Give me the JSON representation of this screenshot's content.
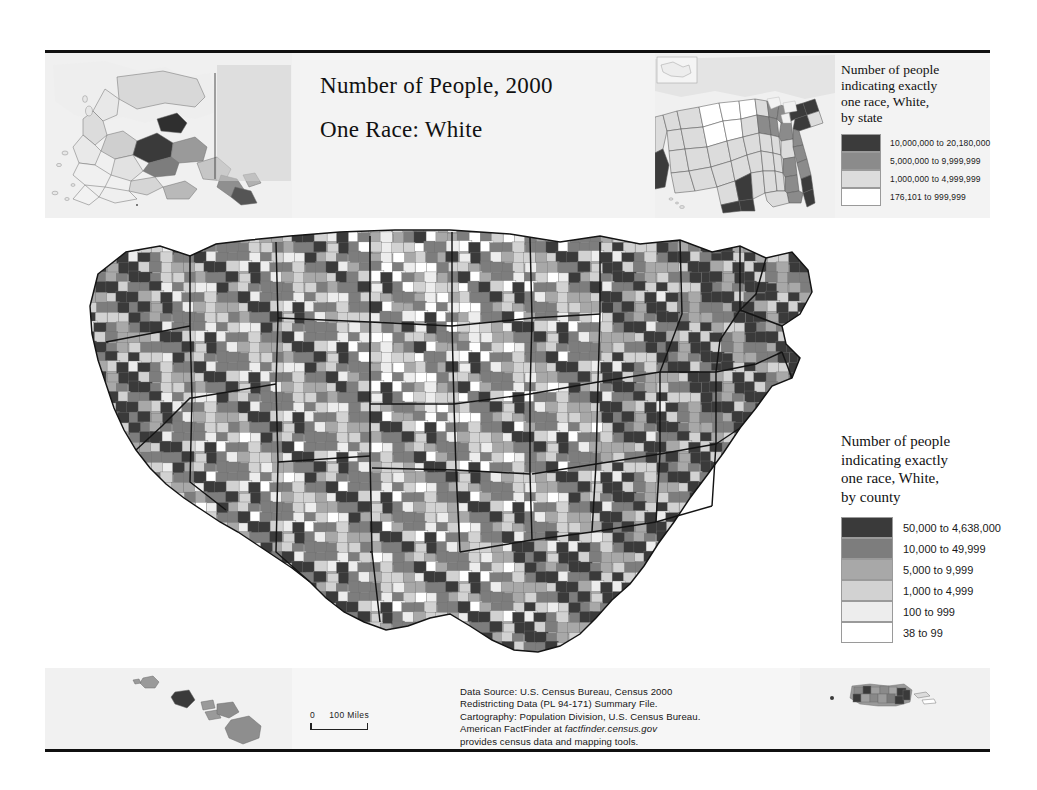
{
  "document": {
    "title_line1": "Number of People, 2000",
    "title_line2": "One Race: White"
  },
  "state_legend": {
    "heading": "Number of people indicating exactly one race, White, by state",
    "heading_lines": [
      "Number of people",
      "indicating exactly",
      "one race, White,",
      "by state"
    ],
    "classes": [
      {
        "label": "10,000,000 to 20,180,000",
        "color": "#3b3b3b"
      },
      {
        "label": "5,000,000 to 9,999,999",
        "color": "#8b8b8b"
      },
      {
        "label": "1,000,000 to 4,999,999",
        "color": "#dcdcdc"
      },
      {
        "label": "176,101 to 999,999",
        "color": "#ffffff"
      }
    ]
  },
  "county_legend": {
    "heading": "Number of people indicating exactly one race, White, by county",
    "heading_lines": [
      "Number of people",
      "indicating exactly",
      "one race, White,",
      "by county"
    ],
    "classes": [
      {
        "label": "50,000 to 4,638,000",
        "color": "#3a3a3a"
      },
      {
        "label": "10,000 to 49,999",
        "color": "#7d7d7d"
      },
      {
        "label": "5,000 to 9,999",
        "color": "#a8a8a8"
      },
      {
        "label": "1,000 to 4,999",
        "color": "#d2d2d2"
      },
      {
        "label": "100 to 999",
        "color": "#ededed"
      },
      {
        "label": "38 to 99",
        "color": "#ffffff"
      }
    ]
  },
  "source_note": {
    "line1": "Data Source: U.S. Census Bureau, Census 2000",
    "line2": "Redistricting Data (PL 94-171) Summary File.",
    "line3": "Cartography: Population Division, U.S. Census Bureau.",
    "line4_pre": "American FactFinder at ",
    "line4_italic": "factfinder.census.gov",
    "line5": "provides census data and mapping tools."
  },
  "scale_bars": {
    "zero": "0",
    "distance": "100 Miles"
  },
  "insets": {
    "alaska_name": "Alaska",
    "hawaii_name": "Hawaii",
    "puerto_rico_name": "Puerto Rico",
    "states_name": "United States by state"
  },
  "chart_data": {
    "type": "map",
    "variable": "Number of people indicating exactly one race, White",
    "geography": [
      "county",
      "state"
    ],
    "county_breaks": [
      38,
      100,
      1000,
      5000,
      10000,
      50000,
      4638000
    ],
    "state_breaks": [
      176101,
      1000000,
      5000000,
      10000000,
      20180000
    ],
    "county_palette": [
      "#ffffff",
      "#ededed",
      "#d2d2d2",
      "#a8a8a8",
      "#7d7d7d",
      "#3a3a3a"
    ],
    "state_palette": [
      "#ffffff",
      "#dcdcdc",
      "#8b8b8b",
      "#3b3b3b"
    ],
    "state_values": [
      {
        "state": "CA",
        "class": 3
      },
      {
        "state": "TX",
        "class": 3
      },
      {
        "state": "NY",
        "class": 3
      },
      {
        "state": "PA",
        "class": 3
      },
      {
        "state": "FL",
        "class": 3
      },
      {
        "state": "OH",
        "class": 2
      },
      {
        "state": "IL",
        "class": 2
      },
      {
        "state": "MI",
        "class": 2
      },
      {
        "state": "NC",
        "class": 2
      },
      {
        "state": "GA",
        "class": 2
      },
      {
        "state": "NJ",
        "class": 2
      },
      {
        "state": "VA",
        "class": 2
      },
      {
        "state": "ND",
        "class": 0
      },
      {
        "state": "SD",
        "class": 0
      },
      {
        "state": "MT",
        "class": 0
      },
      {
        "state": "WY",
        "class": 0
      },
      {
        "state": "VT",
        "class": 0
      },
      {
        "state": "AK",
        "class": 0
      },
      {
        "state": "HI",
        "class": 0
      },
      {
        "state": "DE",
        "class": 0
      }
    ]
  }
}
